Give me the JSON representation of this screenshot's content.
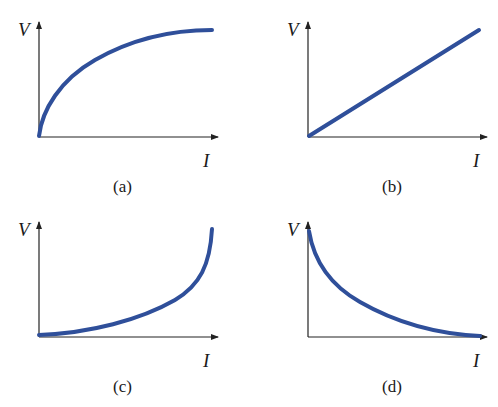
{
  "figure": {
    "panels": [
      {
        "id": "a",
        "caption": "(a)",
        "y_label": "V",
        "x_label": "I",
        "shape": "concave-increasing (saturating)"
      },
      {
        "id": "b",
        "caption": "(b)",
        "y_label": "V",
        "x_label": "I",
        "shape": "linear increasing"
      },
      {
        "id": "c",
        "caption": "(c)",
        "y_label": "V",
        "x_label": "I",
        "shape": "convex increasing (exponential-like)"
      },
      {
        "id": "d",
        "caption": "(d)",
        "y_label": "V",
        "x_label": "I",
        "shape": "decreasing decay"
      }
    ],
    "curve_color": "#2f4f9a"
  }
}
